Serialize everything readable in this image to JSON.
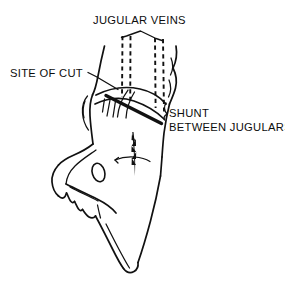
{
  "figure": {
    "background_color": "#ffffff",
    "ink_color": "#111111",
    "width": 285,
    "height": 287,
    "style": "black-and-white line drawing"
  },
  "labels": {
    "jugular_veins": "JUGULAR VEINS",
    "site_of_cut": "SITE OF CUT",
    "shunt_line1": "SHUNT",
    "shunt_line2": "BETWEEN JUGULARS"
  },
  "annotations": [
    {
      "id": "jugular-veins",
      "text": "JUGULAR VEINS",
      "position": "top-center",
      "leader": "inverted-V bracket pointing to two dashed vein pairs",
      "points_to": "paired dashed vertical vessels in neck"
    },
    {
      "id": "site-of-cut",
      "text": "SITE OF CUT",
      "position": "upper-left",
      "leader": "straight angled line to neck skin",
      "points_to": "incision location on the neck"
    },
    {
      "id": "shunt-between-jugulars",
      "text": "SHUNT BETWEEN JUGULARS",
      "position": "middle-right",
      "leader": "short hooked bracket",
      "points_to": "curved vessel crossing between left and right jugular veins"
    }
  ],
  "anatomy": {
    "subject": "bird head and neck, lateral-oblique view",
    "parts": [
      "cranium",
      "eye socket",
      "upper beak",
      "lower beak",
      "neck",
      "left jugular vein",
      "right jugular vein",
      "shunt vessel",
      "surgical incision"
    ]
  }
}
